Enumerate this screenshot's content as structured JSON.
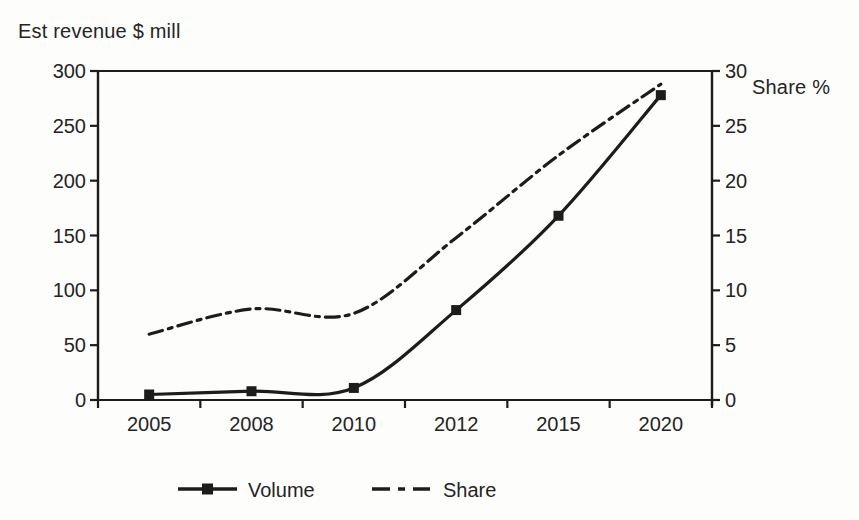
{
  "chart_data": {
    "type": "line",
    "categories": [
      "2005",
      "2008",
      "2010",
      "2012",
      "2015",
      "2020"
    ],
    "series": [
      {
        "name": "Volume",
        "axis": "left",
        "style": "solid",
        "marker": "square",
        "values": [
          5,
          8,
          11,
          82,
          168,
          278
        ]
      },
      {
        "name": "Share",
        "axis": "right",
        "style": "dash-dot",
        "marker": "none",
        "values": [
          6.0,
          8.3,
          7.9,
          14.8,
          22.3,
          28.8
        ]
      }
    ],
    "left_axis": {
      "label": "Est revenue $ mill",
      "min": 0,
      "max": 300,
      "ticks": [
        0,
        50,
        100,
        150,
        200,
        250,
        300
      ]
    },
    "right_axis": {
      "label": "Share %",
      "min": 0,
      "max": 30,
      "ticks": [
        0,
        5,
        10,
        15,
        20,
        25,
        30
      ]
    },
    "grid": false,
    "legend_position": "bottom",
    "legend": [
      "Volume",
      "Share"
    ]
  },
  "colors": {
    "line": "#1c1c1c",
    "axis": "#1c1c1c",
    "text": "#242424",
    "background": "#fdfdfc"
  }
}
